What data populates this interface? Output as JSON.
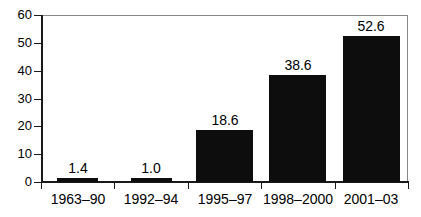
{
  "chart_data": {
    "type": "bar",
    "title": "",
    "subtitle": "",
    "xlabel": "",
    "ylabel": "",
    "categories": [
      "1963–90",
      "1992–94",
      "1995–97",
      "1998–2000",
      "2001–03"
    ],
    "values": [
      1.4,
      1.0,
      18.6,
      38.6,
      52.6
    ],
    "value_labels": [
      "1.4",
      "1.0",
      "18.6",
      "38.6",
      "52.6"
    ],
    "ylim": [
      0,
      60
    ],
    "yticks": [
      0,
      10,
      20,
      30,
      40,
      50,
      60
    ],
    "ytick_labels": [
      "0",
      "10",
      "20",
      "30",
      "40",
      "50",
      "60"
    ],
    "grid": false,
    "legend": null,
    "bar_color": "#0d0d0d",
    "axis_color": "#1a1a1a",
    "background": "#ffffff"
  }
}
